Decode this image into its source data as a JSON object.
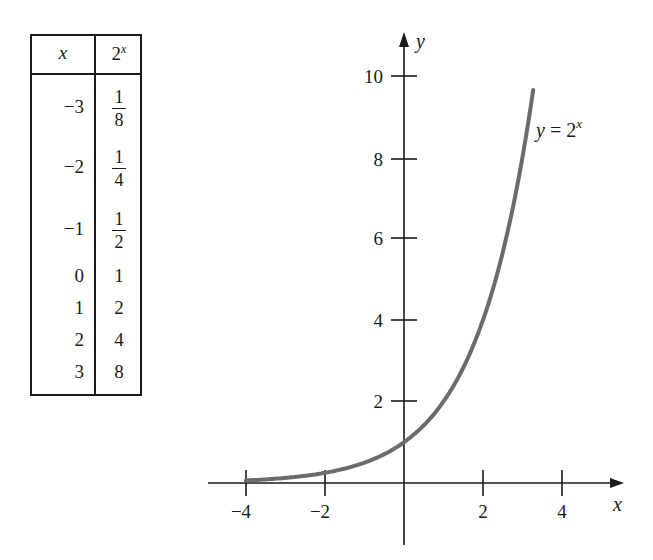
{
  "table": {
    "headers": {
      "x": "x",
      "y": "2",
      "y_sup": "x"
    },
    "rows": [
      {
        "x": "−3",
        "num": "1",
        "den": "8",
        "fraction": true
      },
      {
        "x": "−2",
        "num": "1",
        "den": "4",
        "fraction": true
      },
      {
        "x": "−1",
        "num": "1",
        "den": "2",
        "fraction": true
      },
      {
        "x": "0",
        "y": "1"
      },
      {
        "x": "1",
        "y": "2"
      },
      {
        "x": "2",
        "y": "4"
      },
      {
        "x": "3",
        "y": "8"
      }
    ]
  },
  "chart": {
    "x_axis_label": "x",
    "y_axis_label": "y",
    "x_tick_labels": [
      "−4",
      "−2",
      "2",
      "4"
    ],
    "y_tick_labels": [
      "2",
      "4",
      "6",
      "8",
      "10"
    ],
    "curve_label": "y = 2",
    "curve_label_sup": "x",
    "curve_color": "#6b6b6b"
  },
  "chart_data": {
    "type": "line",
    "title": "",
    "xlabel": "x",
    "ylabel": "y",
    "series": [
      {
        "name": "y = 2^x",
        "x": [
          -4,
          -3,
          -2,
          -1,
          0,
          1,
          2,
          3,
          3.27
        ],
        "values": [
          0.0625,
          0.125,
          0.25,
          0.5,
          1,
          2,
          4,
          8,
          9.65
        ]
      }
    ],
    "table": {
      "columns": [
        "x",
        "2^x"
      ],
      "rows": [
        [
          -3,
          "1/8"
        ],
        [
          -2,
          "1/4"
        ],
        [
          -1,
          "1/2"
        ],
        [
          0,
          1
        ],
        [
          1,
          2
        ],
        [
          2,
          4
        ],
        [
          3,
          8
        ]
      ]
    },
    "x_ticks": [
      -4,
      -2,
      2,
      4
    ],
    "y_ticks": [
      2,
      4,
      6,
      8,
      10
    ],
    "xlim": [
      -5,
      5.5
    ],
    "ylim": [
      -2,
      11
    ],
    "grid": false,
    "legend": "none",
    "annotations": [
      "y = 2^x"
    ]
  }
}
